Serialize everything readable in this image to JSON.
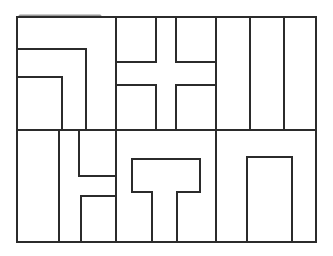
{
  "diagram": {
    "width": 333,
    "height": 256,
    "background": "#ffffff",
    "stroke": "#2b2b2b",
    "stroke_width": 2,
    "outer_frame": {
      "x1": 17,
      "y1": 17,
      "x2": 316,
      "y2": 242
    },
    "row_divider_y": 130,
    "top_smudge": {
      "x1": 20,
      "x2": 100,
      "y": 16,
      "color": "#555555"
    },
    "segments": [
      {
        "id": "v-top-116",
        "x1": 116,
        "y1": 17,
        "x2": 116,
        "y2": 242
      },
      {
        "id": "v-216",
        "x1": 216,
        "y1": 17,
        "x2": 216,
        "y2": 242
      },
      {
        "id": "h-row-divider",
        "x1": 17,
        "y1": 130,
        "x2": 316,
        "y2": 130
      },
      {
        "id": "L1-h",
        "x1": 17,
        "y1": 49,
        "x2": 86,
        "y2": 49
      },
      {
        "id": "L1-v",
        "x1": 86,
        "y1": 49,
        "x2": 86,
        "y2": 130
      },
      {
        "id": "L2-h",
        "x1": 17,
        "y1": 77,
        "x2": 62,
        "y2": 77
      },
      {
        "id": "L2-v",
        "x1": 62,
        "y1": 77,
        "x2": 62,
        "y2": 130
      },
      {
        "id": "cross-tl-v",
        "x1": 156,
        "y1": 17,
        "x2": 156,
        "y2": 62
      },
      {
        "id": "cross-tl-h",
        "x1": 116,
        "y1": 62,
        "x2": 156,
        "y2": 62
      },
      {
        "id": "cross-tr-v",
        "x1": 176,
        "y1": 17,
        "x2": 176,
        "y2": 62
      },
      {
        "id": "cross-tr-h",
        "x1": 176,
        "y1": 62,
        "x2": 216,
        "y2": 62
      },
      {
        "id": "cross-bl-h",
        "x1": 116,
        "y1": 85,
        "x2": 156,
        "y2": 85
      },
      {
        "id": "cross-bl-v",
        "x1": 156,
        "y1": 85,
        "x2": 156,
        "y2": 130
      },
      {
        "id": "cross-br-h",
        "x1": 176,
        "y1": 85,
        "x2": 216,
        "y2": 85
      },
      {
        "id": "cross-br-v",
        "x1": 176,
        "y1": 85,
        "x2": 176,
        "y2": 130
      },
      {
        "id": "stripe-v-250",
        "x1": 250,
        "y1": 17,
        "x2": 250,
        "y2": 130
      },
      {
        "id": "stripe-v-284",
        "x1": 284,
        "y1": 17,
        "x2": 284,
        "y2": 130
      },
      {
        "id": "bl-v-59",
        "x1": 59,
        "y1": 130,
        "x2": 59,
        "y2": 242
      },
      {
        "id": "bl-v-79",
        "x1": 79,
        "y1": 130,
        "x2": 79,
        "y2": 176
      },
      {
        "id": "bl-h-176",
        "x1": 79,
        "y1": 176,
        "x2": 116,
        "y2": 176
      },
      {
        "id": "bl-h-196",
        "x1": 81,
        "y1": 196,
        "x2": 116,
        "y2": 196
      },
      {
        "id": "bl-v-81",
        "x1": 81,
        "y1": 196,
        "x2": 81,
        "y2": 242
      }
    ],
    "polylines": [
      {
        "id": "t-shape",
        "points": "152,242 152,192 132,192 132,159 200,159 200,192 177,192 177,242"
      },
      {
        "id": "arch-rect",
        "points": "247,242 247,157 292,157 292,242"
      }
    ]
  }
}
